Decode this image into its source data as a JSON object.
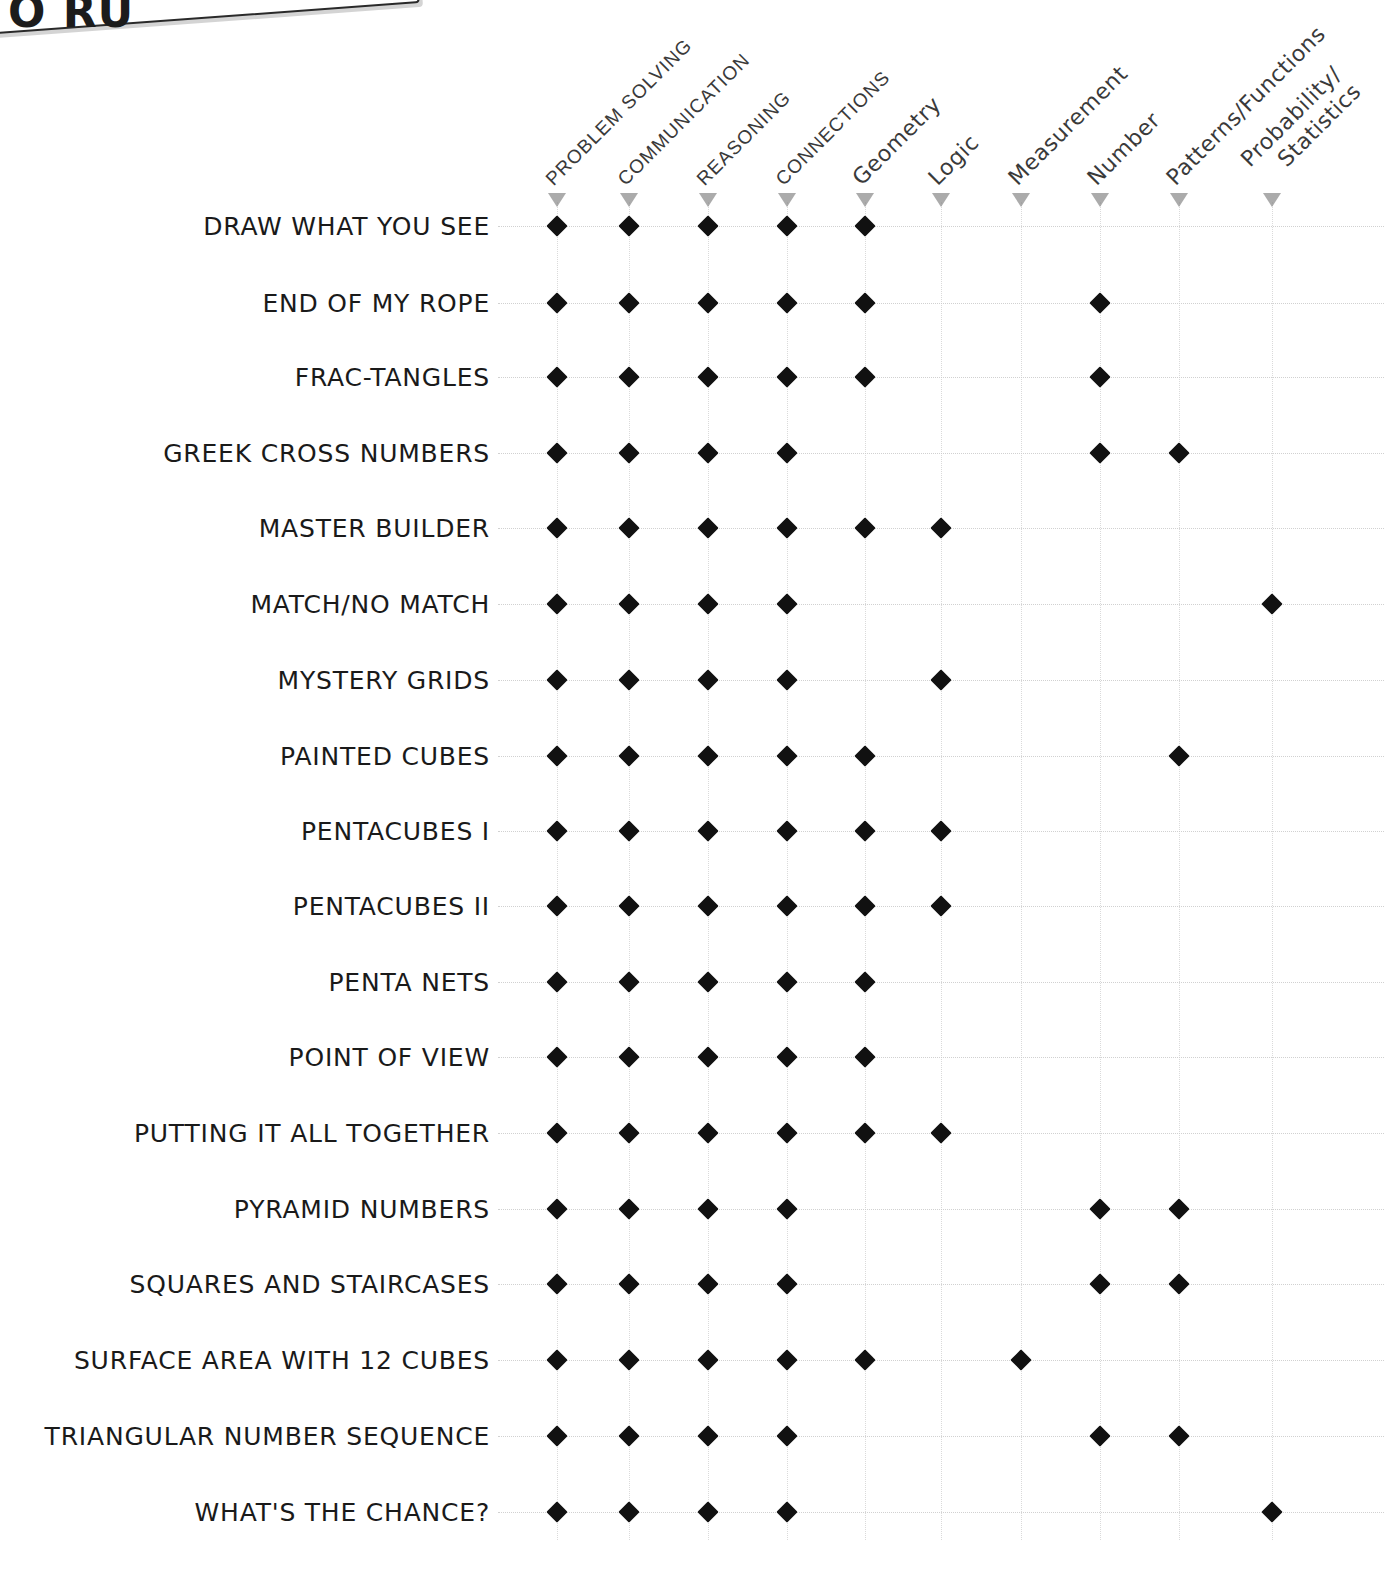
{
  "artifact": {
    "title_fragment": "O RU",
    "note": "cut-off title box at top-left of scanned page"
  },
  "matrix": {
    "columns": [
      {
        "label": "PROBLEM SOLVING",
        "style": "upper",
        "x": 557
      },
      {
        "label": "COMMUNICATION",
        "style": "upper",
        "x": 629
      },
      {
        "label": "REASONING",
        "style": "upper",
        "x": 708
      },
      {
        "label": "CONNECTIONS",
        "style": "upper",
        "x": 787
      },
      {
        "label": "Geometry",
        "style": "lower",
        "x": 865
      },
      {
        "label": "Logic",
        "style": "lower",
        "x": 941
      },
      {
        "label": "Measurement",
        "style": "lower",
        "x": 1021
      },
      {
        "label": "Number",
        "style": "lower",
        "x": 1100
      },
      {
        "label": "Patterns/Functions",
        "style": "lower",
        "x": 1179
      },
      {
        "label": "Probability/",
        "label2": "Statistics",
        "style": "lower",
        "x": 1272
      }
    ],
    "rows": [
      {
        "label": "DRAW WHAT YOU SEE",
        "y": 226,
        "marks": [
          0,
          1,
          2,
          3,
          4
        ]
      },
      {
        "label": "END OF MY ROPE",
        "y": 303,
        "marks": [
          0,
          1,
          2,
          3,
          4,
          7
        ]
      },
      {
        "label": "FRAC-TANGLES",
        "y": 377,
        "marks": [
          0,
          1,
          2,
          3,
          4,
          7
        ]
      },
      {
        "label": "GREEK CROSS NUMBERS",
        "y": 453,
        "marks": [
          0,
          1,
          2,
          3,
          7,
          8
        ]
      },
      {
        "label": "MASTER BUILDER",
        "y": 528,
        "marks": [
          0,
          1,
          2,
          3,
          4,
          5
        ]
      },
      {
        "label": "MATCH/NO MATCH",
        "y": 604,
        "marks": [
          0,
          1,
          2,
          3,
          9
        ]
      },
      {
        "label": "MYSTERY GRIDS",
        "y": 680,
        "marks": [
          0,
          1,
          2,
          3,
          5
        ]
      },
      {
        "label": "PAINTED CUBES",
        "y": 756,
        "marks": [
          0,
          1,
          2,
          3,
          4,
          8
        ]
      },
      {
        "label": "PENTACUBES I",
        "y": 831,
        "marks": [
          0,
          1,
          2,
          3,
          4,
          5
        ]
      },
      {
        "label": "PENTACUBES II",
        "y": 906,
        "marks": [
          0,
          1,
          2,
          3,
          4,
          5
        ]
      },
      {
        "label": "PENTA NETS",
        "y": 982,
        "marks": [
          0,
          1,
          2,
          3,
          4
        ]
      },
      {
        "label": "POINT OF VIEW",
        "y": 1057,
        "marks": [
          0,
          1,
          2,
          3,
          4
        ]
      },
      {
        "label": "PUTTING IT ALL TOGETHER",
        "y": 1133,
        "marks": [
          0,
          1,
          2,
          3,
          4,
          5
        ]
      },
      {
        "label": "PYRAMID NUMBERS",
        "y": 1209,
        "marks": [
          0,
          1,
          2,
          3,
          7,
          8
        ]
      },
      {
        "label": "SQUARES AND STAIRCASES",
        "y": 1284,
        "marks": [
          0,
          1,
          2,
          3,
          7,
          8
        ]
      },
      {
        "label": "SURFACE AREA WITH 12 CUBES",
        "y": 1360,
        "marks": [
          0,
          1,
          2,
          3,
          4,
          6
        ]
      },
      {
        "label": "TRIANGULAR NUMBER SEQUENCE",
        "y": 1436,
        "marks": [
          0,
          1,
          2,
          3,
          7,
          8
        ]
      },
      {
        "label": "WHAT'S THE CHANCE?",
        "y": 1512,
        "marks": [
          0,
          1,
          2,
          3,
          9
        ]
      }
    ],
    "marker_glyph": "filled-diamond",
    "label_right_edge": 490,
    "colors": {
      "marker": "#111111",
      "text": "#1a1a1a",
      "header_text": "#3a3a3a",
      "grid": "#c9c9c9",
      "triangle": "#8f8f8f",
      "background": "#ffffff"
    }
  }
}
